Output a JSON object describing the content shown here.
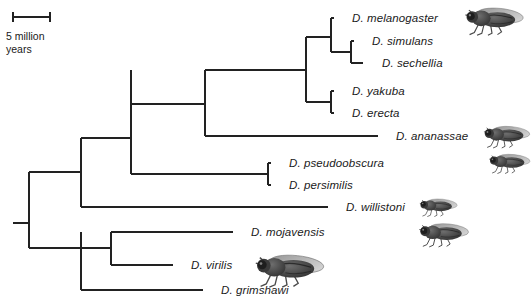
{
  "figure": {
    "kind": "phylogenetic-tree",
    "organism_group": "Drosophila",
    "line_color": "#222222",
    "background_color": "#ffffff",
    "text_color": "#1a1a1a"
  },
  "scale_bar": {
    "label": "5 million\nyears",
    "value": 5,
    "unit": "million years",
    "x_start_px": 13,
    "x_end_px": 50,
    "y_px": 17,
    "tick_half_height_px": 5
  },
  "tips": [
    {
      "name": "D. melanogaster",
      "label_x": 352,
      "y": 18,
      "branch_x": 334,
      "has_fly": true
    },
    {
      "name": "D. simulans",
      "label_x": 372,
      "y": 41,
      "branch_x": 354,
      "has_fly": false
    },
    {
      "name": "D. sechellia",
      "label_x": 382,
      "y": 63,
      "branch_x": 363,
      "has_fly": false
    },
    {
      "name": "D. yakuba",
      "label_x": 352,
      "y": 91,
      "branch_x": 334,
      "has_fly": false
    },
    {
      "name": "D. erecta",
      "label_x": 352,
      "y": 113,
      "branch_x": 334,
      "has_fly": false
    },
    {
      "name": "D. ananassae",
      "label_x": 396,
      "y": 136,
      "branch_x": 378,
      "has_fly": true
    },
    {
      "name": "D. pseudoobscura",
      "label_x": 289,
      "y": 163,
      "branch_x": 271,
      "has_fly": true
    },
    {
      "name": "D. persimilis",
      "label_x": 289,
      "y": 185,
      "branch_x": 271,
      "has_fly": false
    },
    {
      "name": "D. willistoni",
      "label_x": 346,
      "y": 207,
      "branch_x": 328,
      "has_fly": true
    },
    {
      "name": "D. mojavensis",
      "label_x": 251,
      "y": 232,
      "branch_x": 233,
      "has_fly": true
    },
    {
      "name": "D. virilis",
      "label_x": 191,
      "y": 265,
      "branch_x": 173,
      "has_fly": true
    },
    {
      "name": "D. grimshawi",
      "label_x": 221,
      "y": 290,
      "branch_x": 203,
      "has_fly": false
    }
  ],
  "nodes": [
    {
      "id": "root",
      "x": 29,
      "y_top": 172,
      "y_bottom": 248,
      "stub_from_x": 13,
      "stub_y": 223
    },
    {
      "id": "sophophora",
      "x": 81,
      "y_top": 138,
      "y_bottom": 207,
      "parent_y": 172
    },
    {
      "id": "melanogaster-grp",
      "x": 131,
      "y_top": 70,
      "y_bottom": 174,
      "parent_y": 138
    },
    {
      "id": "melanogaster-sub",
      "x": 205,
      "y_top": 70,
      "y_bottom": 136,
      "parent_y": 104
    },
    {
      "id": "mel-yak-split",
      "x": 306,
      "y_top": 37,
      "y_bottom": 102,
      "parent_y": 70
    },
    {
      "id": "mel-sim-sec",
      "x": 331,
      "y_top": 18,
      "y_bottom": 52,
      "parent_y": 37
    },
    {
      "id": "sim-sec",
      "x": 351,
      "y_top": 41,
      "y_bottom": 63,
      "parent_y": 52
    },
    {
      "id": "yak-ere",
      "x": 331,
      "y_top": 91,
      "y_bottom": 113,
      "parent_y": 102
    },
    {
      "id": "obscura-grp",
      "x": 268,
      "y_top": 163,
      "y_bottom": 185,
      "parent_y": 174
    },
    {
      "id": "drosophila-sub",
      "x": 81,
      "y_top": 232,
      "y_bottom": 290,
      "parent_y": 248
    },
    {
      "id": "repleta-virilis",
      "x": 111,
      "y_top": 232,
      "y_bottom": 265,
      "parent_y": 248
    }
  ],
  "fly_images": [
    {
      "for": "D. melanogaster",
      "x": 456,
      "y": 2,
      "w": 72,
      "h": 34,
      "flip": false
    },
    {
      "for": "D. ananassae",
      "x": 478,
      "y": 120,
      "w": 54,
      "h": 30,
      "flip": false
    },
    {
      "for": "D. pseudoobscura",
      "x": 484,
      "y": 148,
      "w": 48,
      "h": 28,
      "flip": false
    },
    {
      "for": "D. willistoni",
      "x": 415,
      "y": 193,
      "w": 44,
      "h": 26,
      "flip": false
    },
    {
      "for": "D. mojavensis",
      "x": 413,
      "y": 218,
      "w": 58,
      "h": 30,
      "flip": false
    },
    {
      "for": "D. virilis",
      "x": 246,
      "y": 248,
      "w": 82,
      "h": 40,
      "flip": false
    }
  ]
}
